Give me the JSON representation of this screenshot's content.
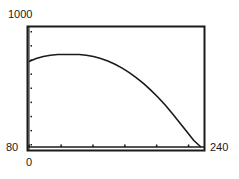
{
  "chart_data": {
    "type": "line",
    "title": "",
    "xlabel": "",
    "ylabel": "",
    "xlim": [
      0,
      240
    ],
    "ylim": [
      80,
      1000
    ],
    "tick_labels": {
      "y_max": "1000",
      "y_min": "80",
      "x_min": "0",
      "x_max": "240"
    },
    "grid": false,
    "x_tick_count": 5,
    "y_tick_count": 8,
    "series": [
      {
        "name": "curve",
        "x": [
          0,
          10,
          20,
          30,
          40,
          50,
          60,
          70,
          80,
          90,
          100,
          110,
          120,
          130,
          140,
          150,
          160,
          170,
          180,
          190,
          200,
          210,
          220,
          230,
          240
        ],
        "y": [
          740,
          765,
          780,
          790,
          795,
          795,
          795,
          795,
          790,
          780,
          765,
          745,
          720,
          690,
          655,
          615,
          570,
          520,
          465,
          405,
          340,
          270,
          200,
          130,
          80
        ]
      }
    ],
    "colors": {
      "line": "#1a1a1a",
      "frame": "#1a1a1a",
      "background": "#ffffff"
    }
  },
  "labels": {
    "y_max": "1000",
    "y_min": "80",
    "x_min": "0",
    "x_max": "240"
  }
}
